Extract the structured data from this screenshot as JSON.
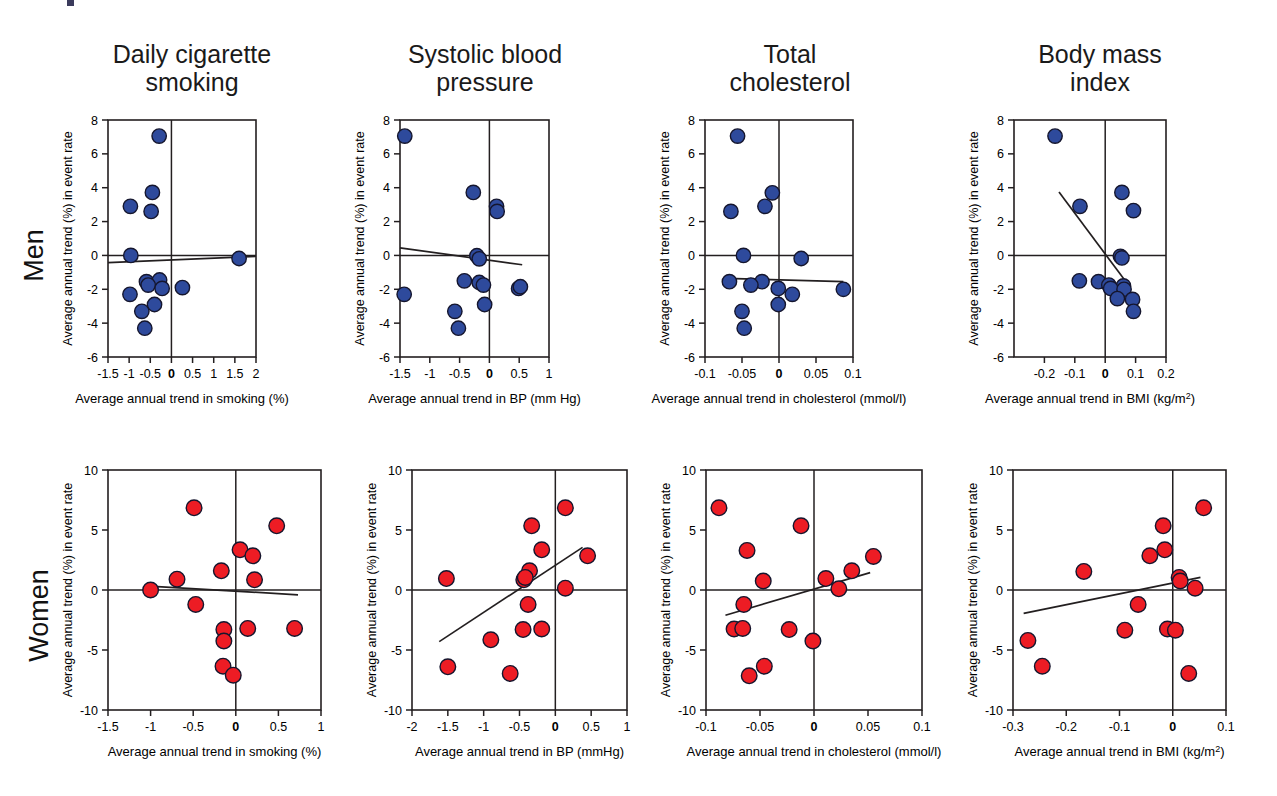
{
  "figure": {
    "column_titles": [
      "Daily cigarette\nsmoking",
      "Systolic blood\npressure",
      "Total\ncholesterol",
      "Body mass\nindex"
    ],
    "row_labels": [
      "Men",
      "Women"
    ],
    "colors": {
      "men_marker": "#2E4A9C",
      "women_marker": "#ED1C24",
      "axis": "#231f20",
      "marker_edge": "#15162e"
    }
  },
  "chart_data": [
    {
      "type": "scatter",
      "title": "Daily cigarette smoking",
      "row": "Men",
      "xlabel": "Average annual trend in smoking (%)",
      "ylabel": "Average annual trend (%) in event rate",
      "xlim": [
        -1.5,
        2
      ],
      "ylim": [
        -6,
        8
      ],
      "xticks": [
        -1.5,
        -1,
        -0.5,
        0,
        0.5,
        1,
        1.5,
        2
      ],
      "xticklabels": [
        "-1.5",
        "-1",
        "-0.5",
        "0",
        "0.5",
        "1",
        "1.5",
        "2"
      ],
      "yticks": [
        -6,
        -4,
        -2,
        0,
        2,
        4,
        6,
        8
      ],
      "yticklabels": [
        "-6",
        "-4",
        "-2",
        "0",
        "2",
        "4",
        "6",
        "8"
      ],
      "grid": false,
      "marker_color": "#2E4A9C",
      "points": [
        {
          "x": -0.29,
          "y": 7.05
        },
        {
          "x": -0.45,
          "y": 3.72
        },
        {
          "x": -0.97,
          "y": 2.9
        },
        {
          "x": -0.48,
          "y": 2.6
        },
        {
          "x": -0.96,
          "y": 0.0
        },
        {
          "x": 1.6,
          "y": -0.18
        },
        {
          "x": -0.59,
          "y": -1.55
        },
        {
          "x": -0.28,
          "y": -1.45
        },
        {
          "x": -0.55,
          "y": -1.75
        },
        {
          "x": -0.22,
          "y": -1.95
        },
        {
          "x": 0.26,
          "y": -1.9
        },
        {
          "x": -0.98,
          "y": -2.3
        },
        {
          "x": -0.4,
          "y": -2.9
        },
        {
          "x": -0.7,
          "y": -3.3
        },
        {
          "x": -0.63,
          "y": -4.3
        }
      ],
      "fit_line": {
        "x0": -1.5,
        "y0": -0.42,
        "x1": 2.0,
        "y1": -0.05
      }
    },
    {
      "type": "scatter",
      "title": "Systolic blood pressure",
      "row": "Men",
      "xlabel": "Average annual trend in BP (mm Hg)",
      "ylabel": "Average annual trend (%) in event rate",
      "xlim": [
        -1.5,
        1
      ],
      "ylim": [
        -6,
        8
      ],
      "xticks": [
        -1.5,
        -1,
        -0.5,
        0,
        0.5,
        1
      ],
      "xticklabels": [
        "-1.5",
        "-1",
        "-0.5",
        "0",
        "0.5",
        "1"
      ],
      "yticks": [
        -6,
        -4,
        -2,
        0,
        2,
        4,
        6,
        8
      ],
      "yticklabels": [
        "-6",
        "-4",
        "-2",
        "0",
        "2",
        "4",
        "6",
        "8"
      ],
      "grid": false,
      "marker_color": "#2E4A9C",
      "points": [
        {
          "x": -1.42,
          "y": 7.05
        },
        {
          "x": -0.27,
          "y": 3.72
        },
        {
          "x": 0.12,
          "y": 2.9
        },
        {
          "x": 0.13,
          "y": 2.6
        },
        {
          "x": -0.21,
          "y": -0.02
        },
        {
          "x": -0.17,
          "y": -0.2
        },
        {
          "x": -0.42,
          "y": -1.5
        },
        {
          "x": -0.17,
          "y": -1.6
        },
        {
          "x": -0.1,
          "y": -1.75
        },
        {
          "x": 0.49,
          "y": -1.95
        },
        {
          "x": 0.52,
          "y": -1.85
        },
        {
          "x": -1.43,
          "y": -2.3
        },
        {
          "x": -0.08,
          "y": -2.9
        },
        {
          "x": -0.58,
          "y": -3.3
        },
        {
          "x": -0.52,
          "y": -4.3
        }
      ],
      "fit_line": {
        "x0": -1.5,
        "y0": 0.45,
        "x1": 0.55,
        "y1": -0.55
      }
    },
    {
      "type": "scatter",
      "title": "Total cholesterol",
      "row": "Men",
      "xlabel": "Average annual trend in cholesterol (mmol/l)",
      "ylabel": "Average annual trend (%) in event rate",
      "xlim": [
        -0.1,
        0.1
      ],
      "ylim": [
        -6,
        8
      ],
      "xticks": [
        -0.1,
        -0.05,
        0,
        0.05,
        0.1
      ],
      "xticklabels": [
        "-0.1",
        "-0.05",
        "0",
        "0.05",
        "0.1"
      ],
      "yticks": [
        -6,
        -4,
        -2,
        0,
        2,
        4,
        6,
        8
      ],
      "yticklabels": [
        "-6",
        "-4",
        "-2",
        "0",
        "2",
        "4",
        "6",
        "8"
      ],
      "grid": false,
      "marker_color": "#2E4A9C",
      "points": [
        {
          "x": -0.056,
          "y": 7.05
        },
        {
          "x": -0.009,
          "y": 3.7
        },
        {
          "x": -0.019,
          "y": 2.9
        },
        {
          "x": -0.065,
          "y": 2.6
        },
        {
          "x": -0.048,
          "y": 0.0
        },
        {
          "x": 0.03,
          "y": -0.18
        },
        {
          "x": -0.067,
          "y": -1.55
        },
        {
          "x": -0.023,
          "y": -1.55
        },
        {
          "x": -0.038,
          "y": -1.75
        },
        {
          "x": -0.001,
          "y": -1.95
        },
        {
          "x": 0.018,
          "y": -2.3
        },
        {
          "x": -0.001,
          "y": -2.9
        },
        {
          "x": -0.05,
          "y": -3.3
        },
        {
          "x": -0.047,
          "y": -4.3
        },
        {
          "x": 0.087,
          "y": -2.0
        }
      ],
      "fit_line": {
        "x0": -0.072,
        "y0": -1.35,
        "x1": 0.087,
        "y1": -1.55
      }
    },
    {
      "type": "scatter",
      "title": "Body mass index",
      "row": "Men",
      "xlabel": "Average annual trend in BMI (kg/m2)",
      "xlabel_base": "Average annual trend in BMI (kg/m",
      "xlabel_sup": "2",
      "xlabel_tail": ")",
      "ylabel": "Average annual trend (%) in event rate",
      "xlim": [
        -0.3,
        0.2
      ],
      "ylim": [
        -6,
        8
      ],
      "xticks": [
        -0.2,
        -0.1,
        0,
        0.1,
        0.2
      ],
      "xticklabels": [
        "-0.2",
        "-0.1",
        "0",
        "0.1",
        "0.2"
      ],
      "yticks": [
        -6,
        -4,
        -2,
        0,
        2,
        4,
        6,
        8
      ],
      "yticklabels": [
        "-6",
        "-4",
        "-2",
        "0",
        "2",
        "4",
        "6",
        "8"
      ],
      "grid": false,
      "marker_color": "#2E4A9C",
      "points": [
        {
          "x": -0.165,
          "y": 7.05
        },
        {
          "x": 0.055,
          "y": 3.72
        },
        {
          "x": 0.093,
          "y": 2.65
        },
        {
          "x": -0.083,
          "y": 2.9
        },
        {
          "x": 0.05,
          "y": -0.05
        },
        {
          "x": 0.055,
          "y": -0.15
        },
        {
          "x": -0.085,
          "y": -1.5
        },
        {
          "x": -0.022,
          "y": -1.55
        },
        {
          "x": 0.012,
          "y": -1.75
        },
        {
          "x": 0.06,
          "y": -1.8
        },
        {
          "x": 0.018,
          "y": -1.95
        },
        {
          "x": 0.062,
          "y": -2.0
        },
        {
          "x": 0.04,
          "y": -2.55
        },
        {
          "x": 0.09,
          "y": -2.6
        },
        {
          "x": 0.093,
          "y": -3.3
        }
      ],
      "fit_line": {
        "x0": -0.152,
        "y0": 3.75,
        "x1": 0.072,
        "y1": -1.65
      }
    },
    {
      "type": "scatter",
      "title": "Daily cigarette smoking",
      "row": "Women",
      "xlabel": "Average annual trend in smoking (%)",
      "ylabel": "Average annual trend (%) in event rate",
      "xlim": [
        -1.5,
        1
      ],
      "ylim": [
        -10,
        10
      ],
      "xticks": [
        -1.5,
        -1,
        -0.5,
        0,
        0.5,
        1
      ],
      "xticklabels": [
        "-1.5",
        "-1",
        "-0.5",
        "0",
        "0.5",
        "1"
      ],
      "yticks": [
        -10,
        -5,
        0,
        5,
        10
      ],
      "yticklabels": [
        "-10",
        "-5",
        "0",
        "5",
        "10"
      ],
      "grid": false,
      "marker_color": "#ED1C24",
      "points": [
        {
          "x": -0.49,
          "y": 6.85
        },
        {
          "x": 0.48,
          "y": 5.35
        },
        {
          "x": 0.05,
          "y": 3.35
        },
        {
          "x": 0.2,
          "y": 2.85
        },
        {
          "x": -0.17,
          "y": 1.6
        },
        {
          "x": -0.69,
          "y": 0.9
        },
        {
          "x": 0.22,
          "y": 0.85
        },
        {
          "x": -1.0,
          "y": 0.0
        },
        {
          "x": -0.47,
          "y": -1.2
        },
        {
          "x": -0.14,
          "y": -3.3
        },
        {
          "x": 0.14,
          "y": -3.2
        },
        {
          "x": 0.69,
          "y": -3.2
        },
        {
          "x": -0.14,
          "y": -4.25
        },
        {
          "x": -0.15,
          "y": -6.35
        },
        {
          "x": -0.03,
          "y": -7.1
        }
      ],
      "fit_line": {
        "x0": -1.07,
        "y0": 0.35,
        "x1": 0.73,
        "y1": -0.4
      }
    },
    {
      "type": "scatter",
      "title": "Systolic blood pressure",
      "row": "Women",
      "xlabel": "Average annual trend in BP (mmHg)",
      "ylabel": "Average annual trend (%) in event rate",
      "xlim": [
        -2,
        1
      ],
      "ylim": [
        -10,
        10
      ],
      "xticks": [
        -2,
        -1.5,
        -1,
        -0.5,
        0,
        0.5,
        1
      ],
      "xticklabels": [
        "-2",
        "-1.5",
        "-1",
        "-0.5",
        "0",
        "0.5",
        "1"
      ],
      "yticks": [
        -10,
        -5,
        0,
        5,
        10
      ],
      "yticklabels": [
        "-10",
        "-5",
        "0",
        "5",
        "10"
      ],
      "grid": false,
      "marker_color": "#ED1C24",
      "points": [
        {
          "x": 0.14,
          "y": 6.85
        },
        {
          "x": -0.33,
          "y": 5.35
        },
        {
          "x": -0.19,
          "y": 3.35
        },
        {
          "x": 0.45,
          "y": 2.85
        },
        {
          "x": -0.36,
          "y": 1.6
        },
        {
          "x": -0.44,
          "y": 0.85
        },
        {
          "x": -1.52,
          "y": 0.95
        },
        {
          "x": 0.14,
          "y": 0.15
        },
        {
          "x": -0.38,
          "y": -1.2
        },
        {
          "x": -0.45,
          "y": -3.3
        },
        {
          "x": -0.19,
          "y": -3.25
        },
        {
          "x": -0.9,
          "y": -4.15
        },
        {
          "x": -1.5,
          "y": -6.4
        },
        {
          "x": -0.63,
          "y": -6.95
        },
        {
          "x": -0.42,
          "y": 1.05
        }
      ],
      "fit_line": {
        "x0": -1.62,
        "y0": -4.3,
        "x1": 0.38,
        "y1": 3.55
      }
    },
    {
      "type": "scatter",
      "title": "Total cholesterol",
      "row": "Women",
      "xlabel": "Average annual trend in cholesterol (mmol/l)",
      "ylabel": "Average annual trend (%) in event rate",
      "xlim": [
        -0.1,
        0.1
      ],
      "ylim": [
        -10,
        10
      ],
      "xticks": [
        -0.1,
        -0.05,
        0,
        0.05,
        0.1
      ],
      "xticklabels": [
        "-0.1",
        "-0.05",
        "0",
        "0.05",
        "0.1"
      ],
      "yticks": [
        -10,
        -5,
        0,
        5,
        10
      ],
      "yticklabels": [
        "-10",
        "-5",
        "0",
        "5",
        "10"
      ],
      "grid": false,
      "marker_color": "#ED1C24",
      "points": [
        {
          "x": -0.088,
          "y": 6.85
        },
        {
          "x": -0.012,
          "y": 5.35
        },
        {
          "x": -0.062,
          "y": 3.3
        },
        {
          "x": 0.055,
          "y": 2.8
        },
        {
          "x": 0.035,
          "y": 1.6
        },
        {
          "x": -0.047,
          "y": 0.75
        },
        {
          "x": 0.011,
          "y": 0.95
        },
        {
          "x": 0.023,
          "y": 0.1
        },
        {
          "x": -0.065,
          "y": -1.2
        },
        {
          "x": -0.074,
          "y": -3.25
        },
        {
          "x": -0.066,
          "y": -3.2
        },
        {
          "x": -0.023,
          "y": -3.3
        },
        {
          "x": -0.001,
          "y": -4.25
        },
        {
          "x": -0.046,
          "y": -6.35
        },
        {
          "x": -0.06,
          "y": -7.15
        }
      ],
      "fit_line": {
        "x0": -0.082,
        "y0": -2.1,
        "x1": 0.052,
        "y1": 1.45
      }
    },
    {
      "type": "scatter",
      "title": "Body mass index",
      "row": "Women",
      "xlabel": "Average annual trend in BMI (kg/m2)",
      "xlabel_base": "Average annual trend in BMI (kg/m",
      "xlabel_sup": "2",
      "xlabel_tail": ")",
      "ylabel": "Average annual trend (%) in event rate",
      "xlim": [
        -0.3,
        0.1
      ],
      "ylim": [
        -10,
        10
      ],
      "xticks": [
        -0.3,
        -0.2,
        -0.1,
        0,
        0.1
      ],
      "xticklabels": [
        "-0.3",
        "-0.2",
        "-0.1",
        "0",
        "0.1"
      ],
      "yticks": [
        -10,
        -5,
        0,
        5,
        10
      ],
      "yticklabels": [
        "-10",
        "-5",
        "0",
        "5",
        "10"
      ],
      "grid": false,
      "marker_color": "#ED1C24",
      "points": [
        {
          "x": 0.058,
          "y": 6.85
        },
        {
          "x": -0.018,
          "y": 5.35
        },
        {
          "x": -0.015,
          "y": 3.35
        },
        {
          "x": -0.043,
          "y": 2.85
        },
        {
          "x": -0.167,
          "y": 1.55
        },
        {
          "x": 0.012,
          "y": 1.05
        },
        {
          "x": 0.014,
          "y": 0.75
        },
        {
          "x": 0.042,
          "y": 0.15
        },
        {
          "x": -0.065,
          "y": -1.2
        },
        {
          "x": -0.09,
          "y": -3.35
        },
        {
          "x": -0.01,
          "y": -3.25
        },
        {
          "x": 0.005,
          "y": -3.35
        },
        {
          "x": -0.272,
          "y": -4.2
        },
        {
          "x": -0.245,
          "y": -6.35
        },
        {
          "x": 0.03,
          "y": -6.95
        }
      ],
      "fit_line": {
        "x0": -0.28,
        "y0": -1.95,
        "x1": 0.052,
        "y1": 1.05
      }
    }
  ]
}
